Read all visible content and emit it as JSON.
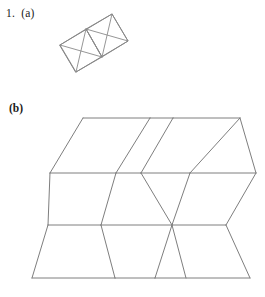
{
  "page": {
    "width": 265,
    "height": 297,
    "background_color": "#ffffff",
    "line_color": "#7e7e7e",
    "text_color": "#1a1a1a"
  },
  "labels": {
    "item_a": "1.  (a)",
    "item_b": "(b)"
  },
  "figures": [
    {
      "id": "figure-a",
      "name": "rotated-rectangle-with-crossed-diagonals",
      "description": "A tilted rectangle divided into two square halves, each containing crossed zig-zag diagonal lines",
      "outline": [
        [
          60,
          45
        ],
        [
          112,
          14
        ],
        [
          128,
          41
        ],
        [
          76,
          72
        ]
      ],
      "divider": [
        [
          86,
          29
        ],
        [
          102,
          57
        ]
      ],
      "diagonals": [
        [
          [
            60,
            45
          ],
          [
            128,
            41
          ]
        ],
        [
          [
            112,
            14
          ],
          [
            76,
            72
          ]
        ],
        [
          [
            60,
            45
          ],
          [
            112,
            14
          ]
        ],
        [
          [
            76,
            72
          ],
          [
            128,
            41
          ]
        ],
        [
          [
            86,
            29
          ],
          [
            102,
            57
          ]
        ]
      ]
    },
    {
      "id": "figure-b",
      "name": "hexagon-tiling",
      "description": "A tiling of six elongated hexagons arranged in two rows of three, forming a parallelogram-like band",
      "rows": 2,
      "columns": 3,
      "horizontal_lines_y": [
        118,
        173,
        225,
        278
      ],
      "left_edge_x": 32,
      "right_edge_x": 256
    }
  ]
}
